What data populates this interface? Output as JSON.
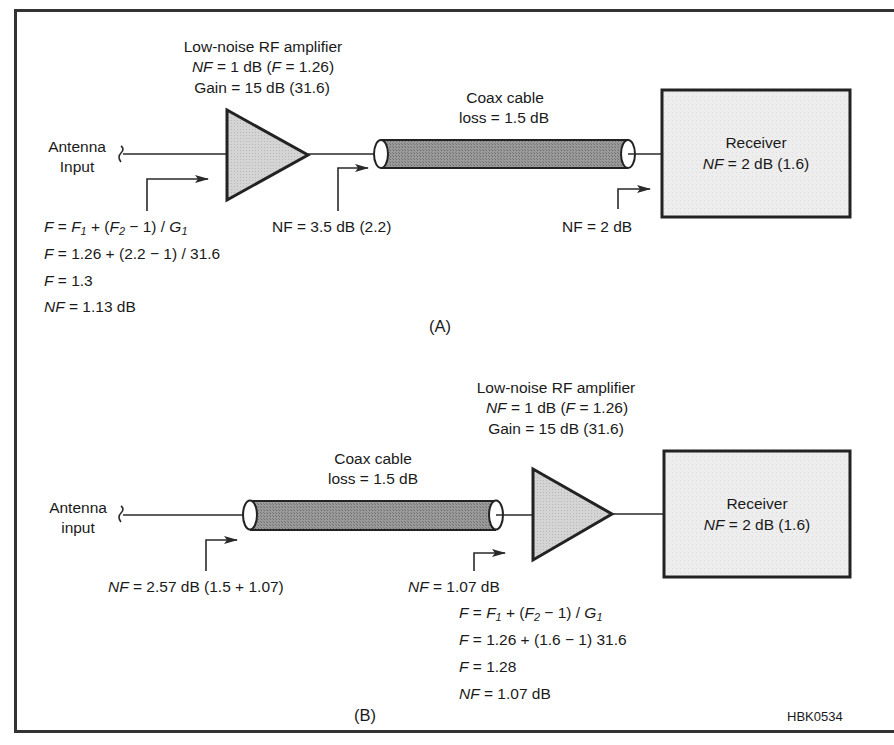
{
  "figure_id": "HBK0534",
  "colors": {
    "stroke": "#2a2a2a",
    "amplifier_fill": "#cfcfcf",
    "coax_fill": "#8c8c8c",
    "receiver_fill": "#ececec"
  },
  "panel_a": {
    "caption": "(A)",
    "antenna": {
      "line1": "Antenna",
      "line2": "Input"
    },
    "amplifier": {
      "title": "Low-noise RF amplifier",
      "nf_prefix": "NF",
      "nf_value": " = 1 dB (",
      "f_prefix": "F",
      "f_value": " = 1.26)",
      "gain": "Gain = 15 dB (31.6)"
    },
    "coax": {
      "title": "Coax cable",
      "loss": "loss = 1.5 dB"
    },
    "receiver": {
      "title": "Receiver",
      "nf_prefix": "NF",
      "nf_value": " = 2 dB (1.6)"
    },
    "point_labels": {
      "after_amp": "NF = 3.5 dB (2.2)",
      "at_receiver": "NF = 2 dB"
    },
    "equations": {
      "line1_lhs": "F",
      "line1_eq": " = ",
      "line1_f": "F",
      "line1_sub1": "1",
      "line1_mid": " + (",
      "line1_f2": "F",
      "line1_sub2": "2",
      "line1_rest": " − 1) / ",
      "line1_g": "G",
      "line1_sub3": "1",
      "line2_lhs": "F",
      "line2_rhs": " = 1.26 + (2.2 − 1) / 31.6",
      "line3_lhs": "F",
      "line3_rhs": " = 1.3",
      "line4_lhs": "NF",
      "line4_rhs": " = 1.13 dB"
    }
  },
  "panel_b": {
    "caption": "(B)",
    "antenna": {
      "line1": "Antenna",
      "line2": "input"
    },
    "amplifier": {
      "title": "Low-noise RF amplifier",
      "nf_prefix": "NF",
      "nf_value": " = 1 dB (",
      "f_prefix": "F",
      "f_value": " = 1.26)",
      "gain": "Gain = 15 dB (31.6)"
    },
    "coax": {
      "title": "Coax cable",
      "loss": "loss = 1.5 dB"
    },
    "receiver": {
      "title": "Receiver",
      "nf_prefix": "NF",
      "nf_value": " = 2 dB (1.6)"
    },
    "point_labels": {
      "at_antenna_prefix": "NF",
      "at_antenna_value": " = 2.57 dB (1.5 + 1.07)",
      "at_amp_prefix": "NF",
      "at_amp_value": " = 1.07 dB"
    },
    "equations": {
      "line1_lhs": "F",
      "line1_eq": " = ",
      "line1_f": "F",
      "line1_sub1": "1",
      "line1_mid": " + (",
      "line1_f2": "F",
      "line1_sub2": "2",
      "line1_rest": " − 1) / ",
      "line1_g": "G",
      "line1_sub3": "1",
      "line2_lhs": "F",
      "line2_rhs": " = 1.26 + (1.6 − 1) 31.6",
      "line3_lhs": "F",
      "line3_rhs": " = 1.28",
      "line4_lhs": "NF",
      "line4_rhs": " = 1.07 dB"
    }
  }
}
